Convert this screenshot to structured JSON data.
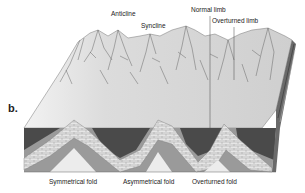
{
  "figure": {
    "panel_label": "b.",
    "top_labels": {
      "anticline": "Anticline",
      "syncline": "Syncline",
      "normal_limb": "Normal limb",
      "overturned_limb": "Overturned limb"
    },
    "bottom_labels": {
      "symmetrical": "Symmetrical fold",
      "asymmetrical": "Asymmetrical fold",
      "overturned": "Overturned fold"
    },
    "colors": {
      "surface": "#d6d6d6",
      "dark_layer": "#4a4a4a",
      "mid_layer": "#9a9a9a",
      "limestone": "#e4e4e4",
      "core": "#ececec",
      "ridge_lines": "#555555"
    }
  }
}
